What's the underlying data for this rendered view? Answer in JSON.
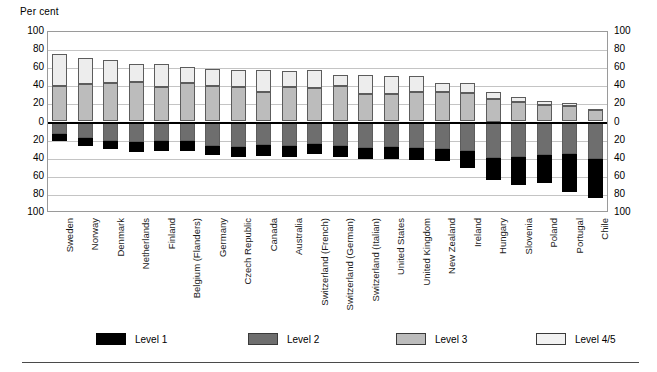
{
  "axis_title": "Per cent",
  "legend": {
    "items": [
      {
        "label": "Level 1",
        "color": "#000000",
        "key": "level1"
      },
      {
        "label": "Level 2",
        "color": "#6e6e6e",
        "key": "level2"
      },
      {
        "label": "Level 3",
        "color": "#bcbcbc",
        "key": "level3"
      },
      {
        "label": "Level 4/5",
        "color": "#f2f2f2",
        "key": "level45"
      }
    ]
  },
  "chart_data": {
    "type": "bar",
    "subtype": "diverging-stacked-bar",
    "title": "",
    "xlabel": "",
    "ylabel": "Per cent",
    "ylim": [
      -100,
      100
    ],
    "y_tick_values": [
      100,
      80,
      60,
      40,
      20,
      0,
      -20,
      -40,
      -60,
      -80,
      -100
    ],
    "y_tick_labels": [
      "100",
      "80",
      "60",
      "40",
      "20",
      "0",
      "20",
      "40",
      "60",
      "80",
      "100"
    ],
    "grid": true,
    "legend_position": "bottom",
    "axis_note": "Levels 1 and 2 are plotted downward (negative direction); Levels 3 and 4/5 are plotted upward (positive direction).",
    "categories": [
      "Sweden",
      "Norway",
      "Denmark",
      "Netherlands",
      "Finland",
      "Belgium (Flanders)",
      "Germany",
      "Czech Republic",
      "Canada",
      "Australia",
      "Switzerland (French)",
      "Switzerland (German)",
      "Switzerland (Italian)",
      "United States",
      "United Kingdom",
      "New Zealand",
      "Ireland",
      "Hungary",
      "Slovenia",
      "Poland",
      "Portugal",
      "Chile"
    ],
    "series": [
      {
        "name": "Level 1",
        "direction": "down",
        "values": [
          8,
          9,
          8,
          11,
          11,
          12,
          10,
          11,
          12,
          12,
          11,
          12,
          13,
          13,
          14,
          14,
          18,
          25,
          31,
          31,
          42,
          44
        ]
      },
      {
        "name": "Level 2",
        "direction": "down",
        "values": [
          14,
          18,
          22,
          23,
          22,
          21,
          27,
          28,
          26,
          27,
          25,
          27,
          29,
          28,
          29,
          30,
          33,
          40,
          39,
          37,
          36,
          41
        ]
      },
      {
        "name": "Level 3",
        "direction": "up",
        "values": [
          39,
          41,
          43,
          44,
          38,
          43,
          39,
          38,
          33,
          38,
          37,
          39,
          30,
          30,
          33,
          33,
          32,
          25,
          21,
          18,
          17,
          13
        ]
      },
      {
        "name": "Level 4/5",
        "direction": "up",
        "values": [
          36,
          29,
          25,
          20,
          25,
          17,
          19,
          19,
          24,
          18,
          20,
          12,
          21,
          20,
          17,
          10,
          11,
          8,
          6,
          5,
          3,
          1
        ]
      }
    ],
    "bar_totals_up": [
      75,
      70,
      68,
      64,
      63,
      60,
      58,
      57,
      57,
      56,
      57,
      51,
      51,
      50,
      50,
      43,
      43,
      33,
      27,
      23,
      20,
      14
    ],
    "bar_totals_down": [
      22,
      27,
      30,
      34,
      33,
      33,
      37,
      39,
      38,
      39,
      36,
      39,
      42,
      41,
      43,
      44,
      51,
      65,
      70,
      68,
      78,
      85
    ]
  }
}
